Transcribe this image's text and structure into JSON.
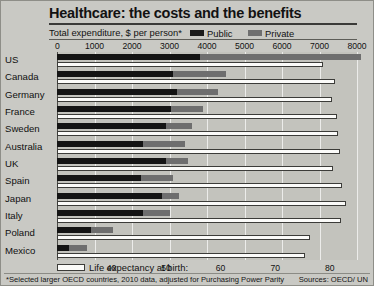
{
  "header": {
    "title": "Healthcare: the costs and the benefits",
    "subtitle": "Total expenditure, $ per person*",
    "legend": [
      {
        "name": "public",
        "label": "Public",
        "color": "#141414"
      },
      {
        "name": "private",
        "label": "Private",
        "color": "#6e6e6e"
      }
    ]
  },
  "footer": {
    "footnote": "*Selected larger OECD countries, 2010 data, adjusted for Purchasing Power Parity",
    "sources": "Sources: OECD/ UN",
    "life_key_label": "Life expectancy at birth:"
  },
  "chart_data": {
    "type": "bar",
    "title": "Healthcare: the costs and the benefits",
    "subtitle": "Total expenditure, $ per person*",
    "orientation": "horizontal",
    "grid": true,
    "legend_position": "top-right",
    "categories": [
      "US",
      "Canada",
      "Germany",
      "France",
      "Sweden",
      "Australia",
      "UK",
      "Spain",
      "Japan",
      "Italy",
      "Poland",
      "Mexico"
    ],
    "xlabel_top": "Total expenditure, $ per person*",
    "xlim_top": [
      0,
      8000
    ],
    "xticks_top": [
      0,
      1000,
      2000,
      3000,
      4000,
      5000,
      6000,
      7000,
      8000
    ],
    "xlabel_bottom": "Life expectancy at birth:",
    "xlim_bottom": [
      30,
      85
    ],
    "xticks_bottom": [
      40,
      50,
      60,
      70,
      80
    ],
    "series": [
      {
        "name": "Public",
        "color": "#141414",
        "unit": "$ per person",
        "axis": "top",
        "values": [
          3800,
          3100,
          3200,
          3050,
          2900,
          2300,
          2900,
          2250,
          2800,
          2300,
          900,
          320
        ]
      },
      {
        "name": "Private",
        "color": "#6e6e6e",
        "unit": "$ per person",
        "axis": "top",
        "stacked": true,
        "values": [
          4300,
          1400,
          1100,
          850,
          700,
          1100,
          600,
          850,
          450,
          700,
          600,
          480
        ]
      },
      {
        "name": "Life expectancy at birth",
        "color": "#fbfbf9",
        "unit": "years",
        "axis": "bottom",
        "values": [
          78.7,
          81.0,
          80.5,
          81.3,
          81.5,
          81.8,
          80.6,
          82.2,
          83.0,
          82.0,
          76.3,
          75.5
        ]
      }
    ]
  },
  "axis_top_ticks": [
    "0",
    "1000",
    "2000",
    "3000",
    "4000",
    "5000",
    "6000",
    "7000",
    "8000"
  ],
  "axis_bottom_ticks": [
    "40",
    "50",
    "60",
    "70",
    "80"
  ],
  "countries": [
    "US",
    "Canada",
    "Germany",
    "France",
    "Sweden",
    "Australia",
    "UK",
    "Spain",
    "Japan",
    "Italy",
    "Poland",
    "Mexico"
  ]
}
